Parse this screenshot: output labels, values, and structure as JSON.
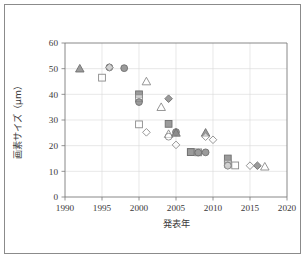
{
  "figure": {
    "frame_color": "#8b8b8b",
    "background": "#ffffff"
  },
  "chart_data": {
    "type": "scatter",
    "title": "",
    "xlabel": "発表年",
    "ylabel": "画素サイズ（μm）",
    "xlim": [
      1990,
      2020
    ],
    "ylim": [
      0,
      60
    ],
    "xticks": [
      1990,
      1995,
      2000,
      2005,
      2010,
      2015,
      2020
    ],
    "xtick_labels": [
      "1990",
      "1995",
      "2000",
      "2005",
      "2010",
      "2015",
      "2020"
    ],
    "yticks": [
      0,
      10,
      20,
      30,
      40,
      50,
      60
    ],
    "ytick_labels": [
      "0",
      "10",
      "20",
      "30",
      "40",
      "50",
      "60"
    ],
    "grid": true,
    "grid_axis": "both",
    "legend": false,
    "legend_position": "none",
    "marker_colors": {
      "gray_fill": "#8a8a8a",
      "gray_edge": "#6f6f6f",
      "open_fill": "#ffffff",
      "open_edge": "#8a8a8a"
    },
    "points": [
      {
        "x": 1992,
        "y": 50.0,
        "marker": "triangle",
        "style": "filled"
      },
      {
        "x": 1995,
        "y": 46.5,
        "marker": "square",
        "style": "open"
      },
      {
        "x": 1996,
        "y": 50.5,
        "marker": "circle",
        "style": "filled"
      },
      {
        "x": 1996,
        "y": 50.5,
        "marker": "diamond",
        "style": "open"
      },
      {
        "x": 1998,
        "y": 50.2,
        "marker": "circle",
        "style": "filled"
      },
      {
        "x": 2000,
        "y": 40.0,
        "marker": "square",
        "style": "filled"
      },
      {
        "x": 2000,
        "y": 38.5,
        "marker": "square",
        "style": "open"
      },
      {
        "x": 2000,
        "y": 37.0,
        "marker": "circle",
        "style": "filled"
      },
      {
        "x": 2000,
        "y": 28.3,
        "marker": "square",
        "style": "open"
      },
      {
        "x": 2001,
        "y": 45.0,
        "marker": "triangle",
        "style": "open"
      },
      {
        "x": 2001,
        "y": 25.2,
        "marker": "diamond",
        "style": "open"
      },
      {
        "x": 2003,
        "y": 35.0,
        "marker": "triangle",
        "style": "open"
      },
      {
        "x": 2004,
        "y": 38.3,
        "marker": "diamond",
        "style": "filled"
      },
      {
        "x": 2004,
        "y": 28.5,
        "marker": "square",
        "style": "filled"
      },
      {
        "x": 2004,
        "y": 24.5,
        "marker": "triangle",
        "style": "open"
      },
      {
        "x": 2004,
        "y": 23.5,
        "marker": "circle",
        "style": "open"
      },
      {
        "x": 2005,
        "y": 25.3,
        "marker": "circle",
        "style": "filled"
      },
      {
        "x": 2005,
        "y": 25.0,
        "marker": "triangle",
        "style": "filled"
      },
      {
        "x": 2005,
        "y": 20.3,
        "marker": "diamond",
        "style": "open"
      },
      {
        "x": 2007,
        "y": 17.5,
        "marker": "square",
        "style": "open"
      },
      {
        "x": 2007,
        "y": 17.5,
        "marker": "square",
        "style": "filled"
      },
      {
        "x": 2008,
        "y": 17.4,
        "marker": "square",
        "style": "open"
      },
      {
        "x": 2008,
        "y": 17.3,
        "marker": "circle",
        "style": "filled"
      },
      {
        "x": 2009,
        "y": 25.0,
        "marker": "triangle",
        "style": "filled"
      },
      {
        "x": 2009,
        "y": 23.5,
        "marker": "diamond",
        "style": "open"
      },
      {
        "x": 2009,
        "y": 17.4,
        "marker": "circle",
        "style": "filled"
      },
      {
        "x": 2010,
        "y": 22.3,
        "marker": "diamond",
        "style": "open"
      },
      {
        "x": 2012,
        "y": 15.0,
        "marker": "square",
        "style": "filled"
      },
      {
        "x": 2012,
        "y": 13.0,
        "marker": "square",
        "style": "open"
      },
      {
        "x": 2012,
        "y": 12.3,
        "marker": "circle",
        "style": "filled"
      },
      {
        "x": 2012,
        "y": 12.2,
        "marker": "circle",
        "style": "open"
      },
      {
        "x": 2013,
        "y": 12.3,
        "marker": "square",
        "style": "open"
      },
      {
        "x": 2015,
        "y": 12.2,
        "marker": "diamond",
        "style": "open"
      },
      {
        "x": 2016,
        "y": 12.2,
        "marker": "diamond",
        "style": "filled"
      },
      {
        "x": 2017,
        "y": 11.8,
        "marker": "triangle",
        "style": "open"
      }
    ]
  }
}
